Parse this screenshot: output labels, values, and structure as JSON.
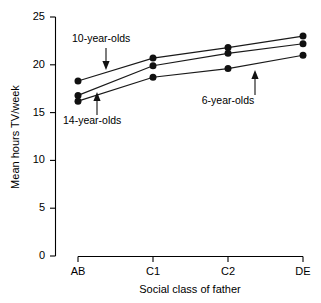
{
  "chart_data": {
    "type": "line",
    "title": "",
    "xlabel": "Social class of father",
    "ylabel": "Mean hours TV/week",
    "categories": [
      "AB",
      "C1",
      "C2",
      "DE"
    ],
    "ylim": [
      0,
      25
    ],
    "yticks": [
      0,
      5,
      10,
      15,
      20,
      25
    ],
    "ytick_labels": [
      "0",
      "5",
      "10",
      "15",
      "20",
      "25"
    ],
    "grid": false,
    "legend": "none (inline annotations with arrows)",
    "marker": "filled circle",
    "series": [
      {
        "name": "10-year-olds",
        "values": [
          18.3,
          20.7,
          21.8,
          23.0
        ]
      },
      {
        "name": "14-year-olds",
        "values": [
          16.8,
          19.9,
          21.2,
          22.2
        ]
      },
      {
        "name": "6-year-olds",
        "values": [
          16.2,
          18.7,
          19.6,
          21.0
        ]
      }
    ],
    "annotations": [
      {
        "text": "10-year-olds",
        "target_series": "10-year-olds",
        "arrow": "down"
      },
      {
        "text": "14-year-olds",
        "target_series": "14-year-olds",
        "arrow": "up"
      },
      {
        "text": "6-year-olds",
        "target_series": "6-year-olds",
        "arrow": "up"
      }
    ]
  },
  "axes": {
    "y_title": "Mean hours TV/week",
    "x_title": "Social class of father",
    "y_ticks": [
      {
        "label": "25",
        "value": 25
      },
      {
        "label": "20",
        "value": 20
      },
      {
        "label": "15",
        "value": 15
      },
      {
        "label": "10",
        "value": 10
      },
      {
        "label": "5",
        "value": 5
      },
      {
        "label": "0",
        "value": 0
      }
    ],
    "x_ticks": [
      {
        "label": "AB"
      },
      {
        "label": "C1"
      },
      {
        "label": "C2"
      },
      {
        "label": "DE"
      }
    ]
  },
  "annotations": {
    "ten": "10-year-olds",
    "fourteen": "14-year-olds",
    "six": "6-year-olds"
  },
  "colors": {
    "ink": "#111111",
    "axis": "#000000",
    "background": "#ffffff"
  }
}
